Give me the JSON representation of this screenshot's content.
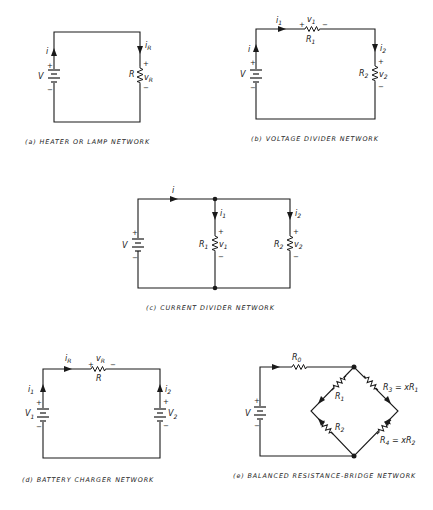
{
  "figures": {
    "a": {
      "caption": "(a) HEATER OR LAMP NETWORK",
      "source": {
        "label": "V",
        "plus": "+",
        "minus": "−"
      },
      "current": "i",
      "resistor": {
        "label": "R",
        "current": "i",
        "current_sub": "R",
        "voltage": "v",
        "voltage_sub": "R",
        "plus": "+",
        "minus": "−"
      }
    },
    "b": {
      "caption": "(b) VOLTAGE DIVIDER NETWORK",
      "source": {
        "label": "V",
        "plus": "+",
        "minus": "−"
      },
      "current": "i",
      "r1": {
        "label": "R",
        "sub": "1",
        "current": "i",
        "current_sub": "1",
        "voltage": "v",
        "voltage_sub": "1",
        "plus": "+",
        "minus": "−"
      },
      "r2": {
        "label": "R",
        "sub": "2",
        "current": "i",
        "current_sub": "2",
        "voltage": "v",
        "voltage_sub": "2",
        "plus": "+",
        "minus": "−"
      }
    },
    "c": {
      "caption": "(c) CURRENT DIVIDER NETWORK",
      "source": {
        "label": "V",
        "plus": "+",
        "minus": "−"
      },
      "current": "i",
      "r1": {
        "label": "R",
        "sub": "1",
        "current": "i",
        "current_sub": "1",
        "voltage": "v",
        "voltage_sub": "1",
        "plus": "+",
        "minus": "−"
      },
      "r2": {
        "label": "R",
        "sub": "2",
        "current": "i",
        "current_sub": "2",
        "voltage": "v",
        "voltage_sub": "2",
        "plus": "+",
        "minus": "−"
      }
    },
    "d": {
      "caption": "(d) BATTERY CHARGER NETWORK",
      "source1": {
        "label": "V",
        "sub": "1",
        "current": "i",
        "current_sub": "1",
        "plus": "+",
        "minus": "−"
      },
      "source2": {
        "label": "V",
        "sub": "2",
        "current": "i",
        "current_sub": "2",
        "plus": "+",
        "minus": "−"
      },
      "resistor": {
        "label": "R",
        "current": "i",
        "current_sub": "R",
        "voltage": "v",
        "voltage_sub": "R",
        "plus": "+",
        "minus": "−"
      }
    },
    "e": {
      "caption": "(e) BALANCED RESISTANCE-BRIDGE NETWORK",
      "source": {
        "label": "V",
        "plus": "+",
        "minus": "−"
      },
      "r0": {
        "label": "R",
        "sub": "0"
      },
      "r1": {
        "label": "R",
        "sub": "1"
      },
      "r2": {
        "label": "R",
        "sub": "2"
      },
      "r3": {
        "label": "R",
        "sub": "3",
        "eq": " = xR",
        "eq_sub": "1"
      },
      "r4": {
        "label": "R",
        "sub": "4",
        "eq": " = xR",
        "eq_sub": "2"
      }
    }
  }
}
